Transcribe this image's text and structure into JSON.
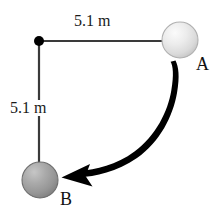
{
  "figure": {
    "background_color": "#ffffff",
    "width": 220,
    "height": 217
  },
  "labels": {
    "top_distance": "5.1 m",
    "left_distance": "5.1 m",
    "ball_a": "A",
    "ball_b": "B"
  },
  "colors": {
    "rod": "#3a3a3a",
    "pivot": "#000000",
    "arrow": "#000000",
    "ball_a_light": "#f2f2f2",
    "ball_a_mid": "#dcdcdc",
    "ball_a_edge": "#b5b5b5",
    "ball_b_light": "#bdbdbd",
    "ball_b_mid": "#9a9a9a",
    "ball_b_edge": "#7a7a7a",
    "text": "#111111"
  },
  "geometry": {
    "pivot": {
      "x": 39,
      "y": 41
    },
    "ball_a": {
      "cx": 180,
      "cy": 40,
      "r": 18
    },
    "ball_b": {
      "cx": 40,
      "cy": 180,
      "r": 18
    },
    "horizontal_rod": {
      "x1": 39,
      "y1": 41,
      "x2": 168,
      "y2": 41
    },
    "vertical_rod": {
      "x1": 39,
      "y1": 41,
      "x2": 39,
      "y2": 168
    },
    "swing_arc": {
      "from": "A",
      "to": "B",
      "direction": "clockwise-down-left"
    }
  }
}
